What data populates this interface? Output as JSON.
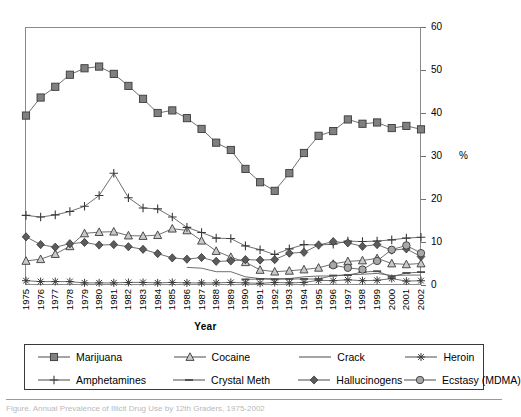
{
  "chart_data": {
    "type": "line",
    "title": "",
    "xlabel": "Year",
    "ylabel": "%",
    "ylim": [
      0,
      60
    ],
    "yticks": [
      0,
      10,
      20,
      30,
      40,
      50,
      60
    ],
    "grid": false,
    "legend_position": "bottom",
    "x": [
      1975,
      1976,
      1977,
      1978,
      1979,
      1980,
      1981,
      1982,
      1983,
      1984,
      1985,
      1986,
      1987,
      1988,
      1989,
      1990,
      1991,
      1992,
      1993,
      1994,
      1995,
      1996,
      1997,
      1998,
      1999,
      2000,
      2001,
      2002
    ],
    "categories": [
      "1975",
      "1976",
      "1977",
      "1978",
      "1979",
      "1980",
      "1981",
      "1982",
      "1983",
      "1984",
      "1985",
      "1986",
      "1987",
      "1988",
      "1989",
      "1990",
      "1991",
      "1992",
      "1993",
      "1994",
      "1995",
      "1996",
      "1997",
      "1998",
      "1999",
      "2000",
      "2001",
      "2002"
    ],
    "series": [
      {
        "name": "Marijuana",
        "marker": "square",
        "color": "#808080",
        "values": [
          39.4,
          43.6,
          46.1,
          48.9,
          50.4,
          50.8,
          49.1,
          46.3,
          43.3,
          40.0,
          40.6,
          38.8,
          36.3,
          33.1,
          31.4,
          27.0,
          23.9,
          21.9,
          26.0,
          30.7,
          34.7,
          35.8,
          38.5,
          37.5,
          37.8,
          36.5,
          37.0,
          36.2
        ]
      },
      {
        "name": "Cocaine",
        "marker": "triangle",
        "color": "#b0b0b0",
        "values": [
          5.6,
          6.0,
          7.2,
          9.0,
          12.0,
          12.3,
          12.4,
          11.5,
          11.4,
          11.6,
          13.1,
          12.7,
          10.3,
          7.9,
          6.5,
          5.3,
          3.5,
          3.1,
          3.3,
          3.6,
          4.0,
          4.9,
          5.5,
          5.7,
          6.2,
          5.0,
          4.8,
          5.0
        ]
      },
      {
        "name": "Crack",
        "marker": "line",
        "color": "#707070",
        "values": [
          0,
          0,
          0,
          0,
          0,
          0,
          0,
          0,
          0,
          0,
          0,
          4.1,
          3.9,
          3.1,
          3.1,
          1.9,
          1.5,
          1.5,
          1.5,
          1.9,
          2.1,
          2.1,
          2.4,
          2.5,
          2.7,
          2.2,
          2.3,
          2.3
        ]
      },
      {
        "name": "Heroin",
        "marker": "asterisk",
        "color": "#555555",
        "values": [
          1.0,
          0.8,
          0.8,
          0.8,
          0.5,
          0.5,
          0.5,
          0.6,
          0.6,
          0.5,
          0.6,
          0.5,
          0.5,
          0.5,
          0.6,
          0.5,
          0.4,
          0.6,
          0.5,
          0.6,
          1.1,
          1.0,
          1.2,
          1.0,
          1.1,
          1.5,
          0.9,
          1.0
        ]
      },
      {
        "name": "Amphetamines",
        "marker": "plus",
        "color": "#606060",
        "values": [
          16.2,
          15.8,
          16.3,
          17.1,
          18.3,
          20.8,
          26.0,
          20.3,
          17.9,
          17.7,
          15.8,
          13.4,
          12.2,
          10.9,
          10.8,
          9.1,
          8.2,
          7.1,
          8.4,
          9.4,
          9.3,
          9.5,
          10.2,
          10.1,
          10.2,
          10.5,
          10.9,
          11.1
        ]
      },
      {
        "name": "Crystal Meth",
        "marker": "dash",
        "color": "#5a5a5a",
        "values": [
          0,
          0,
          0,
          0,
          0,
          0,
          0,
          0,
          0,
          0,
          0,
          0,
          0,
          0,
          0,
          1.3,
          1.4,
          1.3,
          1.4,
          1.4,
          1.4,
          2.2,
          2.3,
          3.0,
          3.2,
          1.9,
          2.8,
          3.0
        ]
      },
      {
        "name": "Hallucinogens",
        "marker": "diamond",
        "color": "#5c5c5c",
        "values": [
          11.2,
          9.4,
          8.8,
          9.6,
          9.9,
          9.3,
          9.4,
          8.9,
          8.3,
          7.3,
          6.3,
          6.0,
          6.4,
          5.5,
          5.6,
          5.9,
          5.8,
          5.9,
          7.4,
          7.6,
          9.3,
          10.1,
          9.8,
          9.0,
          9.4,
          8.1,
          8.4,
          6.6
        ]
      },
      {
        "name": "Ecstasy (MDMA)",
        "marker": "circle",
        "color": "#9a9a9a",
        "values": [
          0,
          0,
          0,
          0,
          0,
          0,
          0,
          0,
          0,
          0,
          0,
          0,
          0,
          0,
          0,
          0,
          0,
          0,
          0,
          0,
          0,
          4.6,
          4.0,
          3.6,
          5.6,
          8.2,
          9.2,
          7.4
        ]
      }
    ]
  },
  "axes": {
    "ytitle": "%",
    "xtitle": "Year"
  },
  "legend": {
    "items": [
      {
        "label": "Marijuana",
        "marker": "square"
      },
      {
        "label": "Cocaine",
        "marker": "triangle"
      },
      {
        "label": "Crack",
        "marker": "line"
      },
      {
        "label": "Heroin",
        "marker": "asterisk"
      },
      {
        "label": "Amphetamines",
        "marker": "plus"
      },
      {
        "label": "Crystal Meth",
        "marker": "dash"
      },
      {
        "label": "Hallucinogens",
        "marker": "diamond"
      },
      {
        "label": "Ecstasy (MDMA)",
        "marker": "circle"
      }
    ]
  },
  "caption": {
    "text": "Figure. Annual Prevalence of Illicit Drug Use by 12th Graders, 1975-2002"
  }
}
